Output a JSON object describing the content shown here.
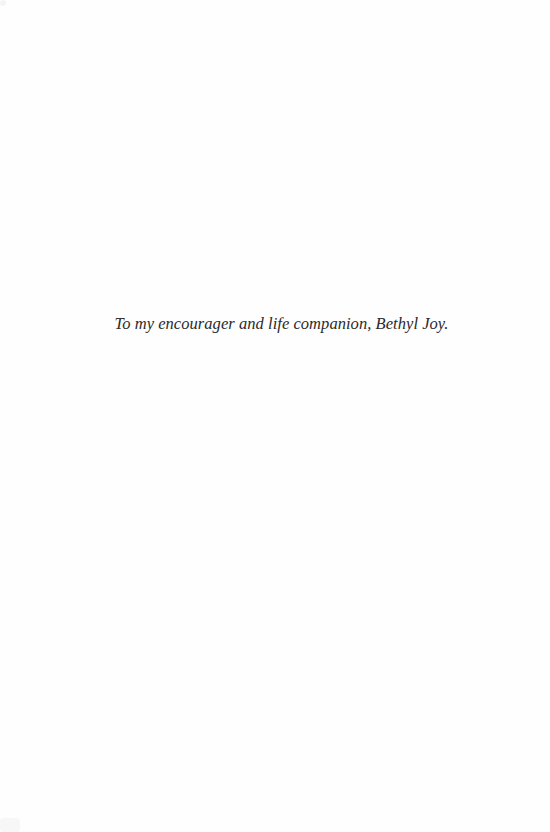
{
  "page": {
    "type": "dedication",
    "background_color": "#ffffff",
    "text_color": "#2a2a2a"
  },
  "dedication": {
    "text": "To my encourager and life companion, Bethyl Joy."
  }
}
